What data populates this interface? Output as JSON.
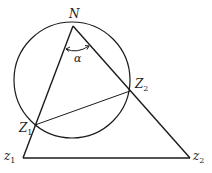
{
  "diagram": {
    "type": "geometry",
    "circle": {
      "cx": 72,
      "cy": 80,
      "r": 58,
      "stroke": "#1a1a1a"
    },
    "points": {
      "N": {
        "x": 73,
        "y": 26,
        "label": "N",
        "sub": ""
      },
      "Z1": {
        "x": 35,
        "y": 125,
        "label": "Z",
        "sub": "1"
      },
      "Z2": {
        "x": 130,
        "y": 91,
        "label": "Z",
        "sub": "2"
      },
      "z1": {
        "x": 23,
        "y": 158,
        "label": "z",
        "sub": "1"
      },
      "z2": {
        "x": 190,
        "y": 158,
        "label": "z",
        "sub": "2"
      }
    },
    "segments": [
      [
        "N",
        "z1"
      ],
      [
        "N",
        "z2"
      ],
      [
        "z1",
        "z2"
      ],
      [
        "Z1",
        "Z2"
      ]
    ],
    "angle": {
      "vertex": "N",
      "label": "α"
    }
  },
  "labels": {
    "N": "N",
    "alpha": "α",
    "Z1_main": "Z",
    "Z1_sub": "1",
    "Z2_main": "Z",
    "Z2_sub": "2",
    "z1_main": "z",
    "z1_sub": "1",
    "z2_main": "z",
    "z2_sub": "2"
  }
}
